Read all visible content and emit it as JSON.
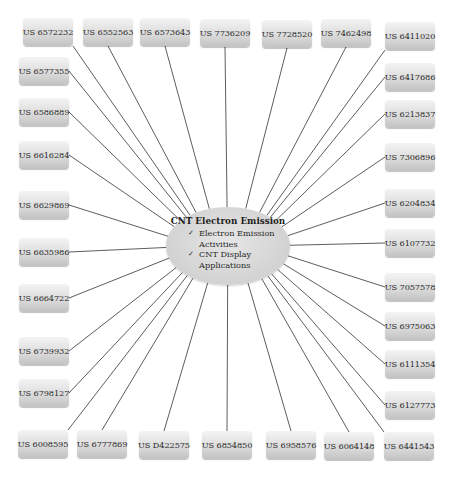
{
  "diagram": {
    "type": "hub-and-spoke",
    "hub": {
      "title": "CNT Electron Emission",
      "items": [
        {
          "icon": "check-icon",
          "text": "Electron Emission",
          "cont": "Activities"
        },
        {
          "icon": "check-icon",
          "text": "CNT Display",
          "cont": "Applications"
        }
      ],
      "check_glyph": "✓"
    },
    "patents": [
      {
        "id": "US 6572232",
        "x": 23,
        "y": 18
      },
      {
        "id": "US 6552563",
        "x": 83,
        "y": 18
      },
      {
        "id": "US 6573643",
        "x": 140,
        "y": 18
      },
      {
        "id": "US 7736209",
        "x": 200,
        "y": 19
      },
      {
        "id": "US 7728520",
        "x": 262,
        "y": 20
      },
      {
        "id": "US 7462498",
        "x": 321,
        "y": 19
      },
      {
        "id": "US 6411020",
        "x": 385,
        "y": 22
      },
      {
        "id": "US 6577355",
        "x": 19,
        "y": 57
      },
      {
        "id": "US 6417686",
        "x": 385,
        "y": 63
      },
      {
        "id": "US 6586889",
        "x": 19,
        "y": 98
      },
      {
        "id": "US 6213837",
        "x": 385,
        "y": 100
      },
      {
        "id": "US 6616284",
        "x": 19,
        "y": 141
      },
      {
        "id": "US 7306896",
        "x": 385,
        "y": 143
      },
      {
        "id": "US 6629869",
        "x": 19,
        "y": 191
      },
      {
        "id": "US 6204834",
        "x": 385,
        "y": 189
      },
      {
        "id": "US 6635986",
        "x": 19,
        "y": 238
      },
      {
        "id": "US 6107732",
        "x": 385,
        "y": 229
      },
      {
        "id": "US 6664722",
        "x": 19,
        "y": 284
      },
      {
        "id": "US 7057578",
        "x": 385,
        "y": 273
      },
      {
        "id": "US 6739932",
        "x": 19,
        "y": 337
      },
      {
        "id": "US 6975063",
        "x": 385,
        "y": 312
      },
      {
        "id": "US 6798127",
        "x": 19,
        "y": 379
      },
      {
        "id": "US 6111354",
        "x": 385,
        "y": 350
      },
      {
        "id": "US 6127773",
        "x": 385,
        "y": 391
      },
      {
        "id": "US 6008595",
        "x": 18,
        "y": 430
      },
      {
        "id": "US 6777869",
        "x": 77,
        "y": 430
      },
      {
        "id": "US D422575",
        "x": 139,
        "y": 431
      },
      {
        "id": "US 6854850",
        "x": 202,
        "y": 431
      },
      {
        "id": "US 6958576",
        "x": 266,
        "y": 431
      },
      {
        "id": "US 6064148",
        "x": 324,
        "y": 432
      },
      {
        "id": "US 6441543",
        "x": 384,
        "y": 432
      }
    ]
  }
}
